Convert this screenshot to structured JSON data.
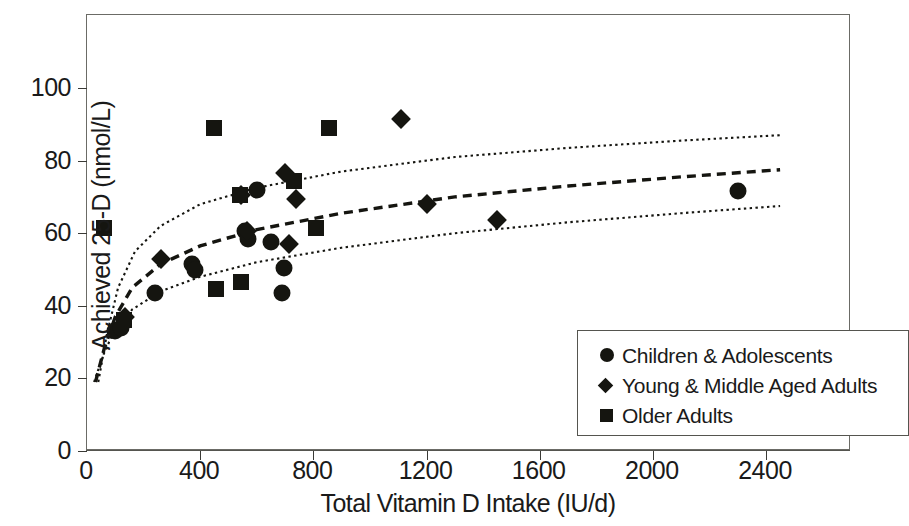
{
  "chart_data": {
    "type": "scatter",
    "title": "",
    "xlabel": "Total Vitamin D Intake (IU/d)",
    "ylabel": "Achieved 25-D (nmol/L)",
    "xlim": [
      0,
      2600
    ],
    "ylim": [
      0,
      115
    ],
    "xticks": [
      0,
      400,
      800,
      1200,
      1600,
      2000,
      2400
    ],
    "yticks": [
      0,
      20,
      40,
      60,
      80,
      100
    ],
    "xtick_labels": [
      "0",
      "400",
      "800",
      "1200",
      "1600",
      "2000",
      "2400"
    ],
    "ytick_labels": [
      "0",
      "20",
      "40",
      "60",
      "80",
      "100"
    ],
    "grid": false,
    "legend_position": "lower-right",
    "series": [
      {
        "name": "Children & Adolescents",
        "marker": "circle",
        "color": "#151510",
        "points": [
          [
            100,
            33
          ],
          [
            120,
            34
          ],
          [
            240,
            43.5
          ],
          [
            370,
            51.5
          ],
          [
            380,
            50
          ],
          [
            560,
            60.5
          ],
          [
            570,
            58.5
          ],
          [
            600,
            72
          ],
          [
            650,
            57.5
          ],
          [
            695,
            50.5
          ],
          [
            690,
            43.5
          ],
          [
            2300,
            71.5
          ]
        ]
      },
      {
        "name": "Young & Middle Aged Adults",
        "marker": "diamond",
        "color": "#151510",
        "points": [
          [
            135,
            37
          ],
          [
            260,
            53
          ],
          [
            545,
            70.5
          ],
          [
            565,
            60.5
          ],
          [
            700,
            76.5
          ],
          [
            715,
            57
          ],
          [
            740,
            69.5
          ],
          [
            1110,
            91.5
          ],
          [
            1200,
            68
          ],
          [
            1450,
            63.5
          ]
        ]
      },
      {
        "name": "Older Adults",
        "marker": "square",
        "color": "#151510",
        "points": [
          [
            60,
            61.5
          ],
          [
            130,
            36
          ],
          [
            450,
            89
          ],
          [
            455,
            44.5
          ],
          [
            545,
            46.5
          ],
          [
            540,
            70.5
          ],
          [
            730,
            74.5
          ],
          [
            810,
            61.5
          ],
          [
            855,
            89
          ]
        ]
      }
    ],
    "curves": [
      {
        "name": "upper-confidence-band",
        "style": "dotted",
        "points": [
          [
            40,
            19
          ],
          [
            70,
            32
          ],
          [
            110,
            45
          ],
          [
            170,
            55
          ],
          [
            260,
            62
          ],
          [
            400,
            68
          ],
          [
            600,
            72.5
          ],
          [
            900,
            77
          ],
          [
            1300,
            81
          ],
          [
            1700,
            83.5
          ],
          [
            2100,
            85.5
          ],
          [
            2450,
            87
          ]
        ]
      },
      {
        "name": "mean-regression-line",
        "style": "dashed",
        "points": [
          [
            30,
            19
          ],
          [
            60,
            28
          ],
          [
            100,
            37
          ],
          [
            160,
            45
          ],
          [
            260,
            51.5
          ],
          [
            400,
            56.5
          ],
          [
            600,
            61
          ],
          [
            900,
            65.5
          ],
          [
            1300,
            70
          ],
          [
            1700,
            73
          ],
          [
            2100,
            75.5
          ],
          [
            2450,
            77.5
          ]
        ]
      },
      {
        "name": "lower-confidence-band",
        "style": "dotted",
        "points": [
          [
            25,
            19
          ],
          [
            55,
            26
          ],
          [
            95,
            33
          ],
          [
            160,
            39
          ],
          [
            260,
            44
          ],
          [
            400,
            48
          ],
          [
            600,
            52
          ],
          [
            900,
            56
          ],
          [
            1300,
            60
          ],
          [
            1700,
            63
          ],
          [
            2100,
            65.5
          ],
          [
            2450,
            67.5
          ]
        ]
      }
    ],
    "legend_entries": [
      {
        "label": "Children & Adolescents",
        "marker": "circle"
      },
      {
        "label": "Young & Middle Aged Adults",
        "marker": "diamond"
      },
      {
        "label": "Older Adults",
        "marker": "square"
      }
    ]
  }
}
